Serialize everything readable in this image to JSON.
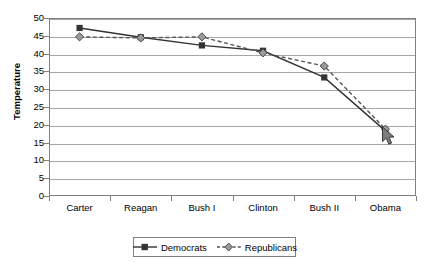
{
  "chart_data": {
    "type": "line",
    "title": "",
    "xlabel": "",
    "ylabel": "Temperature",
    "categories": [
      "Carter",
      "Reagan",
      "Bush I",
      "Clinton",
      "Bush II",
      "Obama"
    ],
    "ylim": [
      0,
      50
    ],
    "ytick_step": 5,
    "yticks": [
      50,
      45,
      40,
      35,
      30,
      25,
      20,
      15,
      10,
      5,
      0
    ],
    "grid": true,
    "legend_position": "bottom",
    "series": [
      {
        "name": "Democrats",
        "marker": "square",
        "line_style": "solid",
        "color": "#333333",
        "values": [
          47.2,
          44.6,
          42.3,
          40.8,
          33.3,
          18.3
        ]
      },
      {
        "name": "Republicans",
        "marker": "diamond",
        "line_style": "dashed",
        "color": "#555555",
        "values": [
          44.7,
          44.4,
          44.7,
          40.2,
          36.5,
          18.8
        ]
      }
    ]
  },
  "axes": {
    "y_title": "Temperature"
  },
  "legend": {
    "items": [
      {
        "label": "Democrats"
      },
      {
        "label": "Republicans"
      }
    ]
  },
  "cursor": {
    "icon": "mouse-pointer-icon"
  }
}
